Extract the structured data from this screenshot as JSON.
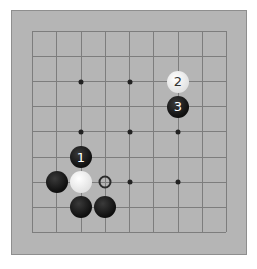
{
  "board": {
    "size": 9,
    "origin": [
      32,
      31
    ],
    "spacing_x": 24.25,
    "spacing_y": 25.1,
    "star_points": [
      [
        2,
        2
      ],
      [
        4,
        2
      ],
      [
        2,
        4
      ],
      [
        4,
        4
      ],
      [
        6,
        4
      ],
      [
        4,
        6
      ],
      [
        6,
        6
      ]
    ],
    "stones": [
      {
        "col": 6,
        "row": 2,
        "color": "white",
        "label": "2"
      },
      {
        "col": 6,
        "row": 3,
        "color": "black",
        "label": "3"
      },
      {
        "col": 2,
        "row": 5,
        "color": "black",
        "label": "1"
      },
      {
        "col": 1,
        "row": 6,
        "color": "black",
        "label": ""
      },
      {
        "col": 2,
        "row": 6,
        "color": "white",
        "label": ""
      },
      {
        "col": 2,
        "row": 7,
        "color": "black",
        "label": ""
      },
      {
        "col": 3,
        "row": 7,
        "color": "black",
        "label": ""
      }
    ],
    "markers": [
      {
        "col": 3,
        "row": 6,
        "type": "circle"
      }
    ]
  }
}
